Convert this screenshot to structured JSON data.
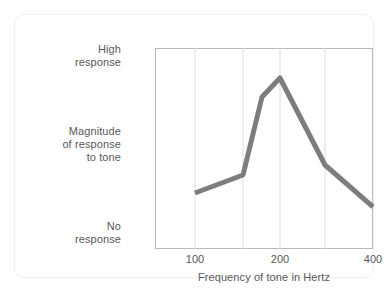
{
  "chart_data": {
    "type": "line",
    "title": "",
    "xlabel": "Frequency of tone in Hertz",
    "ylabel": "Magnitude\nof response\nto tone",
    "y_axis_top_label": "High\nresponse",
    "y_axis_bottom_label": "No\nresponse",
    "grid": true,
    "grid_axis": "x",
    "legend": null,
    "xlim": [
      80,
      400
    ],
    "ylim": [
      0,
      1
    ],
    "xticks": [
      {
        "label": "100",
        "pos": 0.1835
      },
      {
        "label": "200",
        "pos": 0.5734
      },
      {
        "label": "400",
        "pos": 1.0
      }
    ],
    "gridline_positions": [
      0.1835,
      0.4037,
      0.5734,
      0.7798
    ],
    "series": [
      {
        "name": "Magnitude of response to tone",
        "color": "#7d7d7d",
        "x": [
          100,
          150,
          175,
          200,
          250,
          400
        ],
        "x_pos": [
          0.1835,
          0.4037,
          0.4908,
          0.5734,
          0.7798,
          1.0
        ],
        "y_pos": [
          0.2786,
          0.3682,
          0.7562,
          0.8507,
          0.4179,
          0.209
        ],
        "points": [
          {
            "x_label": "100",
            "y_label": "low response"
          },
          {
            "x_label": "150",
            "y_label": "slightly higher response"
          },
          {
            "x_label": "175",
            "y_label": "near-peak response"
          },
          {
            "x_label": "200",
            "y_label": "peak response"
          },
          {
            "x_label": "250",
            "y_label": "declining response"
          },
          {
            "x_label": "400",
            "y_label": "lowest response"
          }
        ]
      }
    ],
    "colors": {
      "line": "#7d7d7d",
      "grid": "#dcdcdc",
      "frame": "#b9b9b9",
      "text": "#58585a",
      "card_border": "#f0f0f0",
      "background": "#ffffff"
    }
  }
}
